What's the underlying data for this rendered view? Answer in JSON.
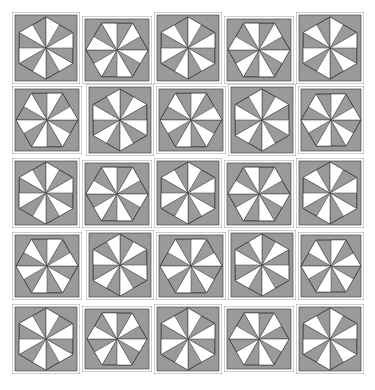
{
  "quilt": {
    "rows": 5,
    "cols": 5,
    "colors": {
      "background": "#ffffff",
      "gray": "#9a9a9a",
      "blade": "#ffffff",
      "line": "#333333",
      "frame": "#888888"
    },
    "blocks": [
      {
        "row": 0,
        "col": 0,
        "x": 0,
        "y": 0,
        "w": 68,
        "h": 72,
        "orient": "pointy",
        "spin": 1
      },
      {
        "row": 0,
        "col": 1,
        "x": 70,
        "y": 4,
        "w": 70,
        "h": 68,
        "orient": "flat",
        "spin": 1
      },
      {
        "row": 0,
        "col": 2,
        "x": 142,
        "y": 0,
        "w": 68,
        "h": 72,
        "orient": "pointy",
        "spin": 1
      },
      {
        "row": 0,
        "col": 3,
        "x": 212,
        "y": 4,
        "w": 70,
        "h": 68,
        "orient": "flat",
        "spin": 1
      },
      {
        "row": 0,
        "col": 4,
        "x": 284,
        "y": 0,
        "w": 68,
        "h": 72,
        "orient": "pointy",
        "spin": 1
      },
      {
        "row": 1,
        "col": 0,
        "x": 0,
        "y": 74,
        "w": 70,
        "h": 68,
        "orient": "flat",
        "spin": -1
      },
      {
        "row": 1,
        "col": 1,
        "x": 74,
        "y": 72,
        "w": 68,
        "h": 72,
        "orient": "pointy",
        "spin": -1
      },
      {
        "row": 1,
        "col": 2,
        "x": 144,
        "y": 74,
        "w": 70,
        "h": 68,
        "orient": "flat",
        "spin": -1
      },
      {
        "row": 1,
        "col": 3,
        "x": 216,
        "y": 72,
        "w": 68,
        "h": 72,
        "orient": "pointy",
        "spin": -1
      },
      {
        "row": 1,
        "col": 4,
        "x": 286,
        "y": 74,
        "w": 66,
        "h": 68,
        "orient": "flat",
        "spin": -1
      },
      {
        "row": 2,
        "col": 0,
        "x": 0,
        "y": 146,
        "w": 68,
        "h": 70,
        "orient": "pointy",
        "spin": 1
      },
      {
        "row": 2,
        "col": 1,
        "x": 70,
        "y": 148,
        "w": 70,
        "h": 68,
        "orient": "flat",
        "spin": 1
      },
      {
        "row": 2,
        "col": 2,
        "x": 142,
        "y": 146,
        "w": 68,
        "h": 70,
        "orient": "pointy",
        "spin": 1
      },
      {
        "row": 2,
        "col": 3,
        "x": 212,
        "y": 148,
        "w": 70,
        "h": 68,
        "orient": "flat",
        "spin": 1
      },
      {
        "row": 2,
        "col": 4,
        "x": 284,
        "y": 146,
        "w": 68,
        "h": 70,
        "orient": "pointy",
        "spin": 1
      },
      {
        "row": 3,
        "col": 0,
        "x": 0,
        "y": 220,
        "w": 70,
        "h": 68,
        "orient": "flat",
        "spin": -1
      },
      {
        "row": 3,
        "col": 1,
        "x": 74,
        "y": 218,
        "w": 68,
        "h": 70,
        "orient": "pointy",
        "spin": -1
      },
      {
        "row": 3,
        "col": 2,
        "x": 144,
        "y": 220,
        "w": 70,
        "h": 68,
        "orient": "flat",
        "spin": -1
      },
      {
        "row": 3,
        "col": 3,
        "x": 216,
        "y": 218,
        "w": 68,
        "h": 70,
        "orient": "pointy",
        "spin": -1
      },
      {
        "row": 3,
        "col": 4,
        "x": 286,
        "y": 220,
        "w": 66,
        "h": 68,
        "orient": "flat",
        "spin": -1
      },
      {
        "row": 4,
        "col": 0,
        "x": 0,
        "y": 292,
        "w": 68,
        "h": 70,
        "orient": "pointy",
        "spin": 1
      },
      {
        "row": 4,
        "col": 1,
        "x": 70,
        "y": 294,
        "w": 70,
        "h": 66,
        "orient": "flat",
        "spin": 1
      },
      {
        "row": 4,
        "col": 2,
        "x": 142,
        "y": 292,
        "w": 68,
        "h": 70,
        "orient": "pointy",
        "spin": 1
      },
      {
        "row": 4,
        "col": 3,
        "x": 212,
        "y": 294,
        "w": 70,
        "h": 66,
        "orient": "flat",
        "spin": 1
      },
      {
        "row": 4,
        "col": 4,
        "x": 284,
        "y": 292,
        "w": 68,
        "h": 70,
        "orient": "pointy",
        "spin": 1
      }
    ]
  }
}
